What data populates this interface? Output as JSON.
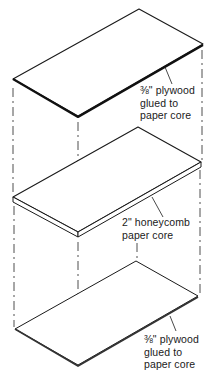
{
  "diagram": {
    "type": "exploded-view",
    "colors": {
      "line": "#1a1a1a",
      "dashed": "#3a3a3a",
      "background": "#ffffff"
    },
    "layers": [
      {
        "id": "top-plywood",
        "label_lines": [
          "⅜\" plywood",
          "glued to",
          "paper core"
        ],
        "thickness": "3/8\""
      },
      {
        "id": "honeycomb-core",
        "label_lines": [
          "2\" honeycomb",
          "paper core"
        ],
        "thickness": "2\""
      },
      {
        "id": "bottom-plywood",
        "label_lines": [
          "⅜\" plywood",
          "glued to",
          "paper core"
        ],
        "thickness": "3/8\""
      }
    ]
  }
}
